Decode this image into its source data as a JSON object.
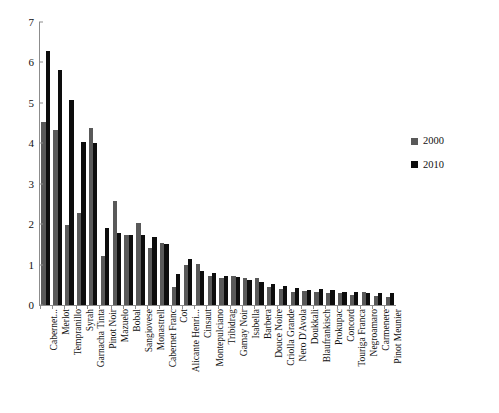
{
  "legend": {
    "position": "right",
    "entries": [
      {
        "label": "2000",
        "color": "#595959"
      },
      {
        "label": "2010",
        "color": "#0d0d0d"
      }
    ]
  },
  "yaxis": {
    "ticks": [
      "0",
      "1",
      "2",
      "3",
      "4",
      "5",
      "6",
      "7"
    ]
  },
  "footer": {
    "note": ""
  },
  "chart_data": {
    "type": "bar",
    "title": "",
    "subtitle": "",
    "xlabel": "",
    "ylabel": "",
    "ylim": [
      0,
      7
    ],
    "ytick_step": 1,
    "grid": false,
    "legend_position": "right",
    "categories": [
      "Cabernet...",
      "Merlot",
      "Tempranillo",
      "Syrah",
      "Garnacha Tinta",
      "Pinot Noir",
      "Mazuelo",
      "Bobal",
      "Sangiovese",
      "Monastrell",
      "Cabernet Franc",
      "Cot",
      "Alicante Henri...",
      "Cinsaut",
      "Montepulciano",
      "Tribidrag",
      "Gamay Noir",
      "Isabella",
      "Barbera",
      "Douce Noire",
      "Criolla Grande",
      "Nero D'Avola",
      "Doukkali",
      "Blaufrankisch",
      "Prokupac",
      "Concord",
      "Touriga Franca",
      "Negroamaro",
      "Carmenere",
      "Pinot Meunier"
    ],
    "series": [
      {
        "name": "2000",
        "color": "#595959",
        "values": [
          4.53,
          4.34,
          1.99,
          2.28,
          4.39,
          1.22,
          2.58,
          1.73,
          2.04,
          1.4,
          1.54,
          0.45,
          0.99,
          1.01,
          0.72,
          0.67,
          0.72,
          0.67,
          0.66,
          0.44,
          0.4,
          0.33,
          0.34,
          0.33,
          0.3,
          0.29,
          0.26,
          0.32,
          0.22,
          0.21
        ]
      },
      {
        "name": "2010",
        "color": "#0d0d0d",
        "values": [
          6.29,
          5.81,
          5.06,
          4.02,
          4.0,
          1.91,
          1.78,
          1.73,
          1.73,
          1.68,
          1.5,
          0.77,
          1.15,
          0.83,
          0.78,
          0.73,
          0.7,
          0.62,
          0.58,
          0.53,
          0.46,
          0.41,
          0.38,
          0.4,
          0.36,
          0.33,
          0.32,
          0.3,
          0.3,
          0.29
        ]
      }
    ]
  }
}
